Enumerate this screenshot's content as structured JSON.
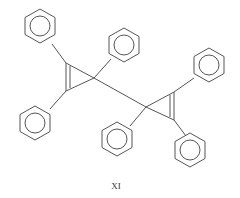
{
  "diagram": {
    "type": "chemical-structure",
    "compound_label": "XI",
    "line_color": "#555555",
    "background": "#ffffff"
  }
}
